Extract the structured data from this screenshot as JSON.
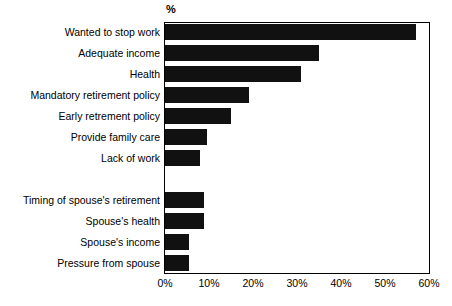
{
  "chart_data": {
    "type": "bar",
    "orientation": "horizontal",
    "title": "",
    "subtitle": "",
    "xlabel": "",
    "ylabel": "",
    "unit_label": "%",
    "xlim": [
      0,
      60
    ],
    "xticks": [
      0,
      10,
      20,
      30,
      40,
      50,
      60
    ],
    "xtick_labels": [
      "0%",
      "10%",
      "20%",
      "30%",
      "40%",
      "50%",
      "60%"
    ],
    "grid": false,
    "legend": null,
    "bar_color": "#111111",
    "categories": [
      "Wanted to stop work",
      "Adequate income",
      "Health",
      "Mandatory retirement policy",
      "Early retrement policy",
      "Provide family care",
      "Lack of work",
      "",
      "Timing of spouse's retirement",
      "Spouse's health",
      "Spouse's income",
      "Pressure from spouse"
    ],
    "values": [
      57,
      35,
      31,
      19,
      15,
      9.5,
      8,
      null,
      8.8,
      8.8,
      5.5,
      5.5
    ]
  },
  "rows": [
    {
      "label": "Wanted to stop work",
      "value": 57,
      "blank": false
    },
    {
      "label": "Adequate income",
      "value": 35,
      "blank": false
    },
    {
      "label": "Health",
      "value": 31,
      "blank": false
    },
    {
      "label": "Mandatory retirement policy",
      "value": 19,
      "blank": false
    },
    {
      "label": "Early retrement policy",
      "value": 15,
      "blank": false
    },
    {
      "label": "Provide family care",
      "value": 9.5,
      "blank": false
    },
    {
      "label": "Lack of work",
      "value": 8,
      "blank": false
    },
    {
      "label": "",
      "value": 0,
      "blank": true
    },
    {
      "label": "Timing of spouse's retirement",
      "value": 8.8,
      "blank": false
    },
    {
      "label": "Spouse's health",
      "value": 8.8,
      "blank": false
    },
    {
      "label": "Spouse's income",
      "value": 5.5,
      "blank": false
    },
    {
      "label": "Pressure from spouse",
      "value": 5.5,
      "blank": false
    }
  ],
  "axis": {
    "unit_label": "%",
    "ticks": [
      "0%",
      "10%",
      "20%",
      "30%",
      "40%",
      "50%",
      "60%"
    ]
  }
}
